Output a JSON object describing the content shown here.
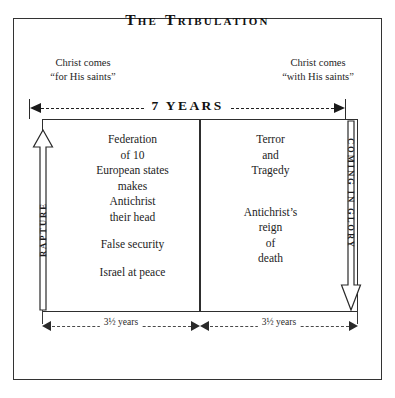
{
  "title_parts": {
    "word1": "The",
    "word2": "Tribulation"
  },
  "captions": {
    "left_line1": "Christ comes",
    "left_line2": "“for His saints”",
    "right_line1": "Christ comes",
    "right_line2": "“with His saints”"
  },
  "timeline": {
    "total_label": "7 YEARS",
    "first_half_label": "3½ years",
    "second_half_label": "3½ years"
  },
  "vertical_arrows": {
    "left_label": "RAPTURE",
    "left_direction": "up",
    "right_label": "COMING IN GLORY",
    "right_direction": "down"
  },
  "panels": {
    "left": {
      "group1": "Federation\nof 10\nEuropean states\nmakes\nAntichrist\ntheir head",
      "group2": "False security",
      "group3": "Israel at peace"
    },
    "right": {
      "group1": "Terror\nand\nTragedy",
      "group2": "Antichrist’s\nreign\nof\ndeath"
    }
  },
  "colors": {
    "ink": "#1a1a1a",
    "frame": "#333333",
    "rule": "#2e2e2e",
    "background": "#ffffff"
  }
}
